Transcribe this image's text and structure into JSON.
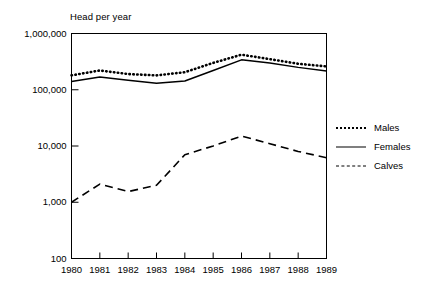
{
  "chart_data": {
    "type": "line",
    "title": "",
    "ylabel": "Head per year",
    "xlabel": "",
    "x": [
      1980,
      1981,
      1982,
      1983,
      1984,
      1985,
      1986,
      1987,
      1988,
      1989
    ],
    "categories": [
      "1980",
      "1981",
      "1982",
      "1983",
      "1984",
      "1985",
      "1986",
      "1987",
      "1988",
      "1989"
    ],
    "yscale": "log",
    "ylim": [
      100,
      1000000
    ],
    "ytick_labels": [
      "1,000,000",
      "100,000",
      "10,000",
      "1,000",
      "100"
    ],
    "ytick_values": [
      1000000,
      100000,
      10000,
      1000,
      100
    ],
    "grid": false,
    "legend_position": "right",
    "series": [
      {
        "name": "Males",
        "style": "dotted",
        "values": [
          180000,
          220000,
          190000,
          180000,
          205000,
          300000,
          420000,
          350000,
          290000,
          260000
        ]
      },
      {
        "name": "Females",
        "style": "solid",
        "values": [
          140000,
          168000,
          148000,
          130000,
          143000,
          220000,
          340000,
          300000,
          250000,
          215000
        ]
      },
      {
        "name": "Calves",
        "style": "dashed",
        "values": [
          1000,
          2100,
          1550,
          2000,
          7000,
          10000,
          15000,
          11000,
          8000,
          6200
        ]
      }
    ]
  },
  "legend": {
    "items": [
      {
        "label": "Males",
        "style": "dotted"
      },
      {
        "label": "Females",
        "style": "solid"
      },
      {
        "label": "Calves",
        "style": "dashed"
      }
    ]
  },
  "colors": {
    "line": "#000000",
    "axis": "#000000",
    "background": "#ffffff"
  }
}
